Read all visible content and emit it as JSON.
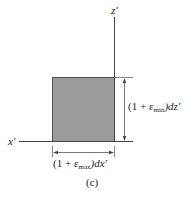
{
  "figure": {
    "caption": "(c)",
    "axes": {
      "vertical_label": "z′",
      "horizontal_label": "x′"
    },
    "element": {
      "shape": "square",
      "fill_color": "#9b9b9b",
      "edge_color": "#555555"
    },
    "dimensions": {
      "vertical": {
        "prefix": "(1 + ",
        "symbol": "ε",
        "subscript": "min",
        "suffix": ")dz′"
      },
      "horizontal": {
        "prefix": "(1 + ",
        "symbol": "ε",
        "subscript": "max",
        "suffix": ")dx′"
      }
    }
  }
}
